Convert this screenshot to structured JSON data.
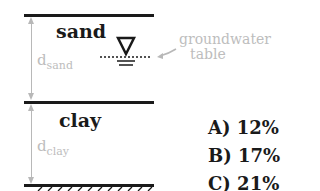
{
  "diagram": {
    "layers": [
      {
        "name": "sand",
        "depth_label": "d",
        "depth_sub": "sand"
      },
      {
        "name": "clay",
        "depth_label": "d",
        "depth_sub": "clay"
      }
    ],
    "groundwater": {
      "label_line1": "groundwater",
      "label_line2": "table",
      "icon": "water-table-triangle-icon"
    },
    "options": [
      {
        "label": "A) 12%"
      },
      {
        "label": "B) 17%"
      },
      {
        "label": "C) 21%"
      }
    ],
    "colors": {
      "line": "#1a1a1a",
      "annotation": "#b8b8b8",
      "text": "#1a1a1a"
    }
  }
}
